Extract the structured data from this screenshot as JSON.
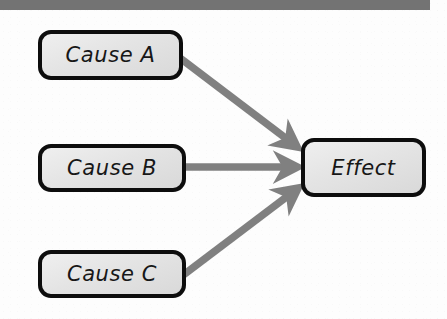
{
  "diagram": {
    "type": "cause-effect",
    "header_bar_color": "#737373",
    "background_color": "#fdfdfd",
    "node_fill_color": "#e4e4e4",
    "node_border_color": "#0d0d0d",
    "arrow_color": "#808080",
    "nodes": [
      {
        "id": "cause-a",
        "label": "Cause A",
        "role": "cause"
      },
      {
        "id": "cause-b",
        "label": "Cause B",
        "role": "cause"
      },
      {
        "id": "cause-c",
        "label": "Cause C",
        "role": "cause"
      },
      {
        "id": "effect",
        "label": "Effect",
        "role": "effect"
      }
    ],
    "edges": [
      {
        "id": "edge-a-effect",
        "from": "Cause A",
        "to": "Effect",
        "style": "arrow"
      },
      {
        "id": "edge-b-effect",
        "from": "Cause B",
        "to": "Effect",
        "style": "arrow"
      },
      {
        "id": "edge-c-effect",
        "from": "Cause C",
        "to": "Effect",
        "style": "arrow"
      }
    ]
  }
}
